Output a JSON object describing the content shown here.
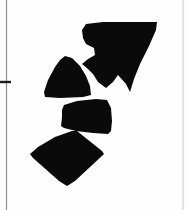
{
  "page": {
    "width": 188,
    "height": 210,
    "background_color": "#fdfdfd",
    "ink_color": "#0a0a0a",
    "rule_color": "#8a8a8a",
    "caption": ""
  },
  "rules": {
    "left_margin_rule": {
      "label": "left margin rule",
      "x": 6.5,
      "y_start": 0,
      "y_end": 210,
      "thickness": 1.2,
      "color": "#8f8f8f"
    },
    "left_tick_mark": {
      "label": "tick mark",
      "x_start": 0,
      "x_end": 11,
      "y": 82,
      "thickness": 2.4,
      "color": "#1a1a1a"
    },
    "right_margin_rule": {
      "label": "right margin rule",
      "x": 183,
      "y_start": 0,
      "y_end": 210,
      "thickness": 1.0,
      "color": "#c9c9c9"
    }
  },
  "chart_data": {
    "type": "scatter",
    "title": "",
    "xlabel": "",
    "ylabel": "",
    "grid": false,
    "legend": "none",
    "xlim": [
      0,
      188
    ],
    "ylim": [
      0,
      210
    ],
    "shapes": [
      {
        "name": "upper-arrow-fragment",
        "fill": "#0a0a0a",
        "points": "86,24 103,22 157,22 156,30 149,46 140,64 134,79 130,92 126,84 118,75 113,82 106,88 98,82 93,74 88,69 82,64 88,59 95,55 94,48 86,44 83,38 82,30"
      },
      {
        "name": "left-wedge-fragment",
        "fill": "#0a0a0a",
        "points": "65,56 72,58 80,66 86,76 90,86 91,95 83,97 60,98 45,97 44,92 48,80 55,67 60,60"
      },
      {
        "name": "middle-trapezoid-fragment",
        "fill": "#0a0a0a",
        "points": "96,99 107,100 111,108 112,121 111,131 108,134 93,133 76,131 64,128 61,126 62,117 62,110 64,105 77,101"
      },
      {
        "name": "lower-quadrilateral-fragment",
        "fill": "#0a0a0a",
        "points": "72,131 77,131 102,151 104,154 75,181 67,186 59,181 33,158 30,154 38,147 55,137"
      }
    ]
  },
  "figure": {
    "label": "fragment-diagram",
    "shape_count": 4,
    "shape_names": [
      "upper-arrow-fragment",
      "left-wedge-fragment",
      "middle-trapezoid-fragment",
      "lower-quadrilateral-fragment"
    ]
  }
}
